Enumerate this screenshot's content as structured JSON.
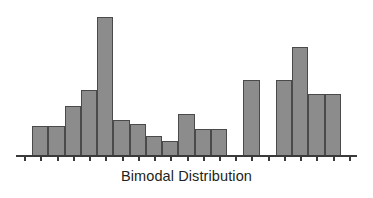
{
  "chart_data": {
    "type": "bar",
    "title": "Bimodal Distribution",
    "xlabel": "Bimodal Distribution",
    "ylabel": "",
    "grid": false,
    "legend": null,
    "axis": {
      "x_visible": true,
      "y_visible": false,
      "tick_count": 21,
      "tick_labels": []
    },
    "colors": {
      "bar_fill": "#8c8c8c",
      "bar_border": "#4a4a4a",
      "axis": "#3a3a3a",
      "title_text": "#231f20",
      "background": "#ffffff"
    },
    "ylim": [
      0,
      145
    ],
    "categories": [
      "1",
      "2",
      "3",
      "4",
      "5",
      "6",
      "7",
      "8",
      "9",
      "10",
      "11",
      "12",
      "13",
      "14",
      "15",
      "16",
      "17",
      "18",
      "19",
      "20",
      "21"
    ],
    "values": [
      0,
      30,
      30,
      50,
      66,
      138,
      36,
      32,
      20,
      15,
      42,
      27,
      27,
      0,
      75,
      0,
      75,
      108,
      62,
      62,
      0
    ]
  }
}
